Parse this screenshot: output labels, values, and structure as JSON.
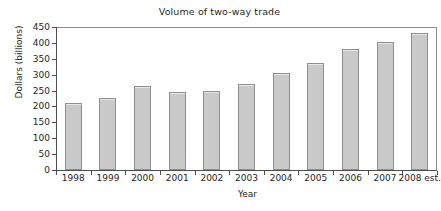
{
  "chart_data": {
    "type": "bar",
    "title": "Volume of two-way trade",
    "xlabel": "Year",
    "ylabel": "Dollars (billions)",
    "categories": [
      "1998",
      "1999",
      "2000",
      "2001",
      "2002",
      "2003",
      "2004",
      "2005",
      "2006",
      "2007",
      "2008 est."
    ],
    "values": [
      210,
      228,
      265,
      247,
      250,
      270,
      306,
      338,
      380,
      403,
      430
    ],
    "ylim": [
      0,
      450
    ],
    "ytick_labels": [
      "0",
      "50",
      "100",
      "150",
      "200",
      "250",
      "300",
      "350",
      "400",
      "450"
    ],
    "ytick_values": [
      0,
      50,
      100,
      150,
      200,
      250,
      300,
      350,
      400,
      450
    ],
    "grid": false,
    "legend": null,
    "bar_color": "#c9c9c9",
    "bar_edge_color": "#8f8f8f",
    "axis_color": "#4d4d4d",
    "background_color": "#ffffff"
  }
}
